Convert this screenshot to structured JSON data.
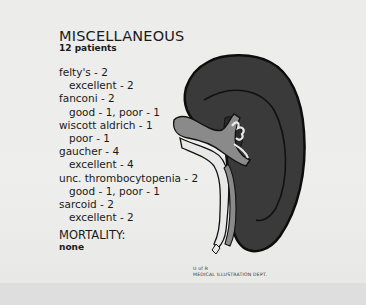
{
  "slide": {
    "title": "MISCELLANEOUS",
    "subtitle": "12 patients",
    "conditions": [
      {
        "name": "felty's - 2",
        "outcome": "excellent - 2"
      },
      {
        "name": "fanconi - 2",
        "outcome": "good - 1, poor - 1"
      },
      {
        "name": "wiscott aldrich - 1",
        "outcome": "poor - 1"
      },
      {
        "name": "gaucher - 4",
        "outcome": "excellent - 4"
      },
      {
        "name": "unc. thrombocytopenia - 2",
        "outcome": "good - 1, poor - 1"
      },
      {
        "name": "sarcoid - 2",
        "outcome": "excellent - 2"
      }
    ],
    "mortality_label": "MORTALITY:",
    "mortality_value": "none",
    "credit_line1": "U of R",
    "credit_line2": "MEDICAL ILLUSTRATION DEPT."
  },
  "illustration": {
    "subject": "spleen-with-hilar-vessels",
    "colors": {
      "organ": "#3a3a3a",
      "outline": "#0d0d0d",
      "vessel_gray": "#8a8a8a",
      "vessel_light": "#e8e8e8",
      "background": "#ececea"
    }
  }
}
